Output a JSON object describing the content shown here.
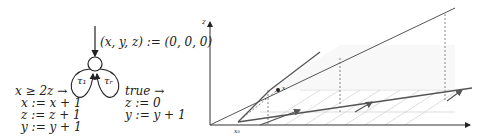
{
  "automaton": {
    "init": "(x, y, z) := (0, 0, 0)",
    "left_loop_label": "τ₁",
    "right_loop_label": "τᵣ",
    "left_guard": "x ≥ 2z →",
    "left_updates": [
      "x := x + 1",
      "z := z + 1",
      "y := y + 1"
    ],
    "right_guard": "true →",
    "right_updates": [
      "z := 0",
      "y := y + 1"
    ]
  },
  "plot": {
    "z_axis_label": "z",
    "origin_label": "x₀",
    "small_label": "x",
    "colors": {
      "axis": "#333333",
      "trajectory": "#555555",
      "hatch": "#cccccc",
      "dashed": "#666666"
    }
  }
}
